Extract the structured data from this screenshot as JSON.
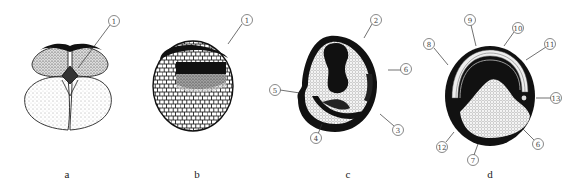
{
  "figure": {
    "panels": [
      {
        "id": "a",
        "label": "a",
        "callouts": [
          {
            "num": "1",
            "glyph": "①"
          }
        ]
      },
      {
        "id": "b",
        "label": "b",
        "callouts": [
          {
            "num": "1",
            "glyph": "①"
          }
        ]
      },
      {
        "id": "c",
        "label": "c",
        "callouts": [
          {
            "num": "2",
            "glyph": "②"
          },
          {
            "num": "3",
            "glyph": "③"
          },
          {
            "num": "4",
            "glyph": "④"
          },
          {
            "num": "5",
            "glyph": "⑤"
          },
          {
            "num": "6",
            "glyph": "⑥"
          }
        ]
      },
      {
        "id": "d",
        "label": "d",
        "callouts": [
          {
            "num": "6",
            "glyph": "⑥"
          },
          {
            "num": "7",
            "glyph": "⑦"
          },
          {
            "num": "8",
            "glyph": "⑧"
          },
          {
            "num": "9",
            "glyph": "⑨"
          },
          {
            "num": "10",
            "glyph": "⑩"
          },
          {
            "num": "11",
            "glyph": "⑪"
          },
          {
            "num": "12",
            "glyph": "⑫"
          },
          {
            "num": "13",
            "glyph": "⑬"
          }
        ]
      }
    ]
  }
}
